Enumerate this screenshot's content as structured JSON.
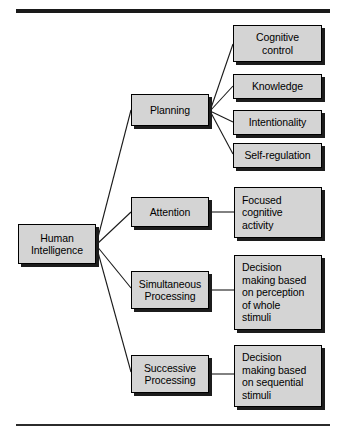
{
  "diagram": {
    "type": "hierarchy-tree",
    "colors": {
      "node_fill": "#d4d4d4",
      "node_border": "#000000",
      "node_shadow": "#1c1c1c",
      "connector": "#1a1a1a",
      "rule": "#1a1a1a",
      "background": "#ffffff"
    },
    "rules": {
      "top_label": "top-divider-rule",
      "bottom_label": "bottom-divider-rule"
    },
    "root": {
      "id": "human-intelligence",
      "label": "Human\nIntelligence",
      "line1": "Human",
      "line2": "Intelligence",
      "align": "center"
    },
    "branches": [
      {
        "id": "planning",
        "label": "Planning",
        "align": "center",
        "children": [
          {
            "id": "cognitive-control",
            "label": "Cognitive\ncontrol",
            "line1": "Cognitive",
            "line2": "control",
            "align": "center"
          },
          {
            "id": "knowledge",
            "label": "Knowledge",
            "line1": "Knowledge",
            "line2": "",
            "align": "center"
          },
          {
            "id": "intentionality",
            "label": "Intentionality",
            "line1": "Intentionality",
            "line2": "",
            "align": "center"
          },
          {
            "id": "self-regulation",
            "label": "Self-regulation",
            "line1": "Self-regulation",
            "line2": "",
            "align": "center"
          }
        ]
      },
      {
        "id": "attention",
        "label": "Attention",
        "align": "center",
        "children": [
          {
            "id": "focused-cognitive-activity",
            "label": "Focused cognitive activity",
            "lines": [
              "Focused",
              "cognitive",
              "activity"
            ],
            "align": "left"
          }
        ]
      },
      {
        "id": "simultaneous-processing",
        "label": "Simultaneous\nProcessing",
        "line1": "Simultaneous",
        "line2": "Processing",
        "align": "center",
        "children": [
          {
            "id": "decision-making-perception-whole-stimuli",
            "label": "Decision making based on perception of whole stimuli",
            "lines": [
              "Decision",
              "making based",
              "on perception",
              "of whole",
              "stimuli"
            ],
            "align": "left"
          }
        ]
      },
      {
        "id": "successive-processing",
        "label": "Successive\nProcessing",
        "line1": "Successive",
        "line2": "Processing",
        "align": "center",
        "children": [
          {
            "id": "decision-making-sequential-stimuli",
            "label": "Decision making based on sequential stimuli",
            "lines": [
              "Decision",
              "making based",
              "on sequential",
              "stimuli"
            ],
            "align": "left"
          }
        ]
      }
    ]
  }
}
